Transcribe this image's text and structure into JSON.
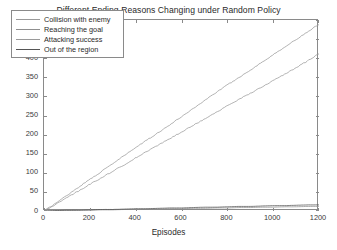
{
  "chart_data": {
    "type": "line",
    "title": "Different Ending Reasons Changing under Random Policy",
    "xlabel": "Episodes",
    "ylabel": "Counts",
    "xlim": [
      0,
      1200
    ],
    "ylim": [
      0,
      500
    ],
    "xticks": [
      0,
      200,
      400,
      600,
      800,
      1000,
      1200
    ],
    "yticks": [
      0,
      50,
      100,
      150,
      200,
      250,
      300,
      350,
      400,
      450,
      500
    ],
    "grid": false,
    "legend_position": "upper left",
    "x": [
      0,
      50,
      100,
      150,
      200,
      250,
      300,
      350,
      400,
      450,
      500,
      550,
      600,
      650,
      700,
      750,
      800,
      850,
      900,
      950,
      1000,
      1050,
      1100,
      1150,
      1200
    ],
    "series": [
      {
        "name": "Collision with enemy",
        "color": "#9a9a9a",
        "values": [
          0,
          20,
          41,
          62,
          83,
          103,
          124,
          145,
          166,
          186,
          206,
          226,
          247,
          268,
          289,
          310,
          330,
          349,
          369,
          389,
          409,
          429,
          449,
          469,
          489
        ]
      },
      {
        "name": "Reaching the goal",
        "color": "#8f8f8f",
        "values": [
          0,
          1,
          1,
          2,
          2,
          3,
          3,
          4,
          4,
          5,
          5,
          6,
          6,
          7,
          7,
          8,
          8,
          9,
          9,
          10,
          10,
          11,
          11,
          12,
          12
        ]
      },
      {
        "name": "Attacking success",
        "color": "#9a9a9a",
        "values": [
          0,
          17,
          35,
          52,
          70,
          87,
          104,
          121,
          139,
          156,
          173,
          190,
          207,
          224,
          241,
          258,
          275,
          292,
          308,
          325,
          341,
          358,
          375,
          393,
          412
        ]
      },
      {
        "name": "Out of the region",
        "color": "#555555",
        "values": [
          0,
          1,
          2,
          2,
          3,
          4,
          4,
          5,
          6,
          6,
          7,
          8,
          8,
          9,
          10,
          10,
          11,
          12,
          12,
          13,
          14,
          14,
          15,
          16,
          16
        ]
      }
    ]
  },
  "axes": {
    "ytick_labels": [
      "500",
      "450",
      "400",
      "350",
      "300",
      "250",
      "200",
      "150",
      "100",
      "50",
      "0"
    ],
    "xtick_labels": [
      "0",
      "200",
      "400",
      "600",
      "800",
      "1000",
      "1200"
    ]
  },
  "legend": {
    "items": [
      {
        "label": "Collision with enemy"
      },
      {
        "label": "Reaching the goal"
      },
      {
        "label": "Attacking success"
      },
      {
        "label": "Out of the region"
      }
    ]
  }
}
